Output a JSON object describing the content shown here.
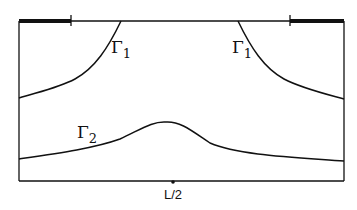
{
  "diagram": {
    "colors": {
      "stroke": "#111111",
      "background": "#ffffff"
    },
    "labels": {
      "gamma1_left": "Γ",
      "gamma1_left_sub": "1",
      "gamma1_right": "Γ",
      "gamma1_right_sub": "1",
      "gamma2": "Γ",
      "gamma2_sub": "2",
      "midpoint": "L/2"
    }
  }
}
